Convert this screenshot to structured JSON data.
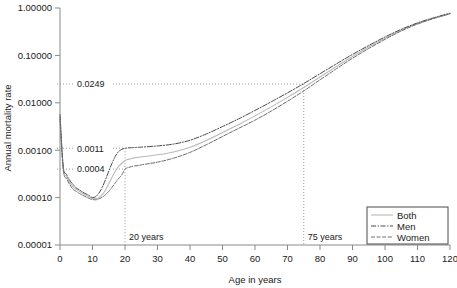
{
  "chart": {
    "title": "",
    "xlabel": "Age in years",
    "ylabel": "Annual mortality rate",
    "legend_title": ""
  },
  "axis": {
    "x_ticks": [
      "0",
      "10",
      "20",
      "30",
      "40",
      "50",
      "60",
      "70",
      "80",
      "90",
      "100",
      "110",
      "120"
    ],
    "y_ticks": [
      "1.00000",
      "0.10000",
      "0.01000",
      "0.00100",
      "0.00010",
      "0.00001"
    ]
  },
  "legend": {
    "items": [
      {
        "label": "Both",
        "style": "solid",
        "color": "#b9b9b9"
      },
      {
        "label": "Men",
        "style": "dashdot",
        "color": "#4a4a4a"
      },
      {
        "label": "Women",
        "style": "dashed",
        "color": "#6e6e6e"
      }
    ]
  },
  "annotations": {
    "value_75": "0.0249",
    "value_men_20": "0.0011",
    "value_women_20": "0.0004",
    "vline_20": "20 years",
    "vline_75": "75 years"
  },
  "chart_data": {
    "type": "line",
    "title": "",
    "xlabel": "Age in years",
    "ylabel": "Annual mortality rate",
    "xlim": [
      0,
      120
    ],
    "ylim": [
      1e-05,
      1.0
    ],
    "yscale": "log",
    "grid": false,
    "legend_position": "bottom-right",
    "x": [
      0,
      1,
      2,
      3,
      4,
      5,
      6,
      7,
      8,
      9,
      10,
      11,
      12,
      13,
      14,
      15,
      16,
      17,
      18,
      19,
      20,
      21,
      22,
      23,
      24,
      25,
      30,
      35,
      40,
      45,
      50,
      55,
      60,
      65,
      70,
      75,
      80,
      85,
      90,
      95,
      100,
      105,
      110,
      115,
      120
    ],
    "series": [
      {
        "name": "Both",
        "style": "solid",
        "color": "#b9b9b9",
        "values": [
          0.005,
          0.00042,
          0.00028,
          0.00021,
          0.00017,
          0.00015,
          0.000135,
          0.000122,
          0.000112,
          0.000103,
          9.6e-05,
          9.5e-05,
          0.0001,
          0.000115,
          0.000145,
          0.000195,
          0.00027,
          0.00036,
          0.00045,
          0.00053,
          0.0006,
          0.00064,
          0.00067,
          0.00069,
          0.000705,
          0.00072,
          0.0008,
          0.00092,
          0.00115,
          0.0016,
          0.00235,
          0.0035,
          0.0053,
          0.0082,
          0.013,
          0.021,
          0.035,
          0.058,
          0.095,
          0.15,
          0.23,
          0.34,
          0.47,
          0.61,
          0.76
        ]
      },
      {
        "name": "Men",
        "style": "dashdot",
        "color": "#4a4a4a",
        "values": [
          0.0056,
          0.00046,
          0.00031,
          0.00023,
          0.00019,
          0.00016,
          0.000145,
          0.00013,
          0.00012,
          0.00011,
          0.0001,
          0.000105,
          0.000125,
          0.000165,
          0.00024,
          0.00036,
          0.00053,
          0.00074,
          0.00093,
          0.00104,
          0.0011,
          0.00112,
          0.00113,
          0.00114,
          0.00115,
          0.00116,
          0.00123,
          0.00135,
          0.00162,
          0.0022,
          0.00315,
          0.0046,
          0.0069,
          0.0105,
          0.0162,
          0.0255,
          0.041,
          0.066,
          0.105,
          0.162,
          0.245,
          0.355,
          0.485,
          0.625,
          0.775
        ]
      },
      {
        "name": "Women",
        "style": "dashed",
        "color": "#6e6e6e",
        "values": [
          0.0044,
          0.00038,
          0.00025,
          0.00019,
          0.00015,
          0.000135,
          0.000122,
          0.000112,
          0.000103,
          9.6e-05,
          9.1e-05,
          9e-05,
          9.4e-05,
          0.000102,
          0.000115,
          0.000135,
          0.000165,
          0.000205,
          0.00025,
          0.0003,
          0.0004,
          0.00043,
          0.00045,
          0.000465,
          0.000475,
          0.00049,
          0.00056,
          0.00068,
          0.0009,
          0.0013,
          0.00195,
          0.0029,
          0.0043,
          0.0067,
          0.0108,
          0.0178,
          0.0305,
          0.052,
          0.087,
          0.14,
          0.218,
          0.328,
          0.458,
          0.6,
          0.752
        ]
      }
    ],
    "reference_lines": [
      {
        "axis": "x",
        "value": 20,
        "label": "20 years",
        "style": "dotted"
      },
      {
        "axis": "x",
        "value": 75,
        "label": "75 years",
        "style": "dotted"
      }
    ],
    "point_annotations": [
      {
        "x": 75,
        "y": 0.0249,
        "label": "0.0249"
      },
      {
        "x": 20,
        "y": 0.0011,
        "label": "0.0011"
      },
      {
        "x": 20,
        "y": 0.0004,
        "label": "0.0004"
      }
    ]
  }
}
